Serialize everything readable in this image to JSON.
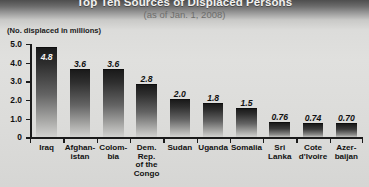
{
  "header": {
    "title": "Top Ten Sources of Displaced Persons",
    "subtitle": "(as of Jan. 1, 2008)",
    "axis_note": "(No. displaced in millions)"
  },
  "chart_data": {
    "type": "bar",
    "title": "Top Ten Sources of Displaced Persons",
    "subtitle": "(as of Jan. 1, 2008)",
    "xlabel": "",
    "ylabel": "(No. displaced in millions)",
    "ylim": [
      0,
      5.0
    ],
    "yticks": [
      "0",
      "1.0",
      "2.0",
      "3.0",
      "4.0",
      "5.0"
    ],
    "ytick_values": [
      0,
      1.0,
      2.0,
      3.0,
      4.0,
      5.0
    ],
    "grid": false,
    "legend": false,
    "categories": [
      "Iraq",
      "Afghan-\nistan",
      "Colom-\nbia",
      "Dem.\nRep.\nof the\nCongo",
      "Sudan",
      "Uganda",
      "Somalia",
      "Sri\nLanka",
      "Cote\nd'Ivoire",
      "Azer-\nbaijan"
    ],
    "values": [
      4.8,
      3.6,
      3.6,
      2.8,
      2.0,
      1.8,
      1.5,
      0.76,
      0.74,
      0.7
    ],
    "value_labels": [
      "4.8",
      "3.6",
      "3.6",
      "2.8",
      "2.0",
      "1.8",
      "1.5",
      "0.76",
      "0.74",
      "0.70"
    ],
    "bar_color": "#2e2e2e",
    "background_color": "#dcdcda"
  }
}
